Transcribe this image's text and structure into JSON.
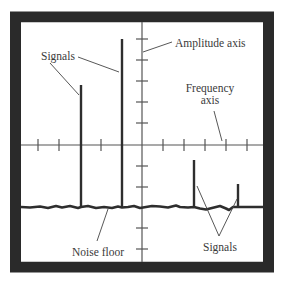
{
  "diagram": {
    "type": "spectrum-analyzer-display",
    "colors": {
      "frame": "#2a2a2a",
      "background": "#ffffff",
      "axis": "#555555",
      "signal": "#2e2e2e",
      "noise": "#2e2e2e",
      "text": "#3a3a3a"
    },
    "labels": {
      "signals_top": "Signals",
      "amplitude_axis": "Amplitude axis",
      "frequency_axis_line1": "Frequency",
      "frequency_axis_line2": "axis",
      "noise_floor": "Noise floor",
      "signals_bottom": "Signals"
    },
    "signals": [
      {
        "name": "signal-medium-left",
        "x": 81,
        "top": 85
      },
      {
        "name": "signal-tall-left",
        "x": 122,
        "top": 39
      },
      {
        "name": "signal-medium-right",
        "x": 194,
        "top": 160
      },
      {
        "name": "signal-small-right",
        "x": 238,
        "top": 184
      }
    ],
    "noise_floor_y": 207
  }
}
